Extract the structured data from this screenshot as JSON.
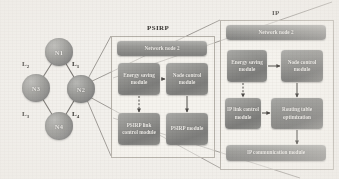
{
  "figure": {
    "background": "#f2f0ec",
    "node_fill": "#8f8f8d",
    "module_fill": "#8b8b88",
    "line_color": "#6f6c68"
  },
  "network": {
    "nodes": [
      {
        "id": "n1",
        "label": "N1"
      },
      {
        "id": "n3",
        "label": "N3"
      },
      {
        "id": "n2",
        "label": "N2"
      },
      {
        "id": "n4",
        "label": "N4"
      }
    ],
    "links": [
      {
        "id": "l1",
        "label": "L",
        "sub": "1"
      },
      {
        "id": "l2",
        "label": "L",
        "sub": "2"
      },
      {
        "id": "l3",
        "label": "L",
        "sub": "3"
      },
      {
        "id": "l4",
        "label": "L",
        "sub": "4"
      }
    ]
  },
  "psirp_panel": {
    "title": "PSIRP",
    "header": "Network node 2",
    "modules": [
      {
        "id": "psirp-energy",
        "label": "Energy saving module"
      },
      {
        "id": "psirp-node-control",
        "label": "Node control module"
      },
      {
        "id": "psirp-link-control",
        "label": "PSIRP link control module"
      },
      {
        "id": "psirp-module",
        "label": "PSIRP module"
      }
    ]
  },
  "ip_panel": {
    "title": "IP",
    "header": "Network node 2",
    "modules": [
      {
        "id": "ip-energy",
        "label": "Energy saving module"
      },
      {
        "id": "ip-node-control",
        "label": "Node control module"
      },
      {
        "id": "ip-link-control",
        "label": "IP link control module"
      },
      {
        "id": "ip-routing",
        "label": "Routing table optimization"
      },
      {
        "id": "ip-communication",
        "label": "IP communication module"
      }
    ]
  }
}
